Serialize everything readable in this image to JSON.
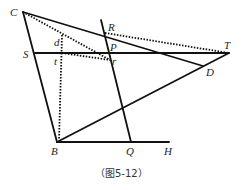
{
  "figure": {
    "caption": "（图5-12）",
    "points": {
      "C": {
        "label": "C",
        "x": 23,
        "y": 12
      },
      "R": {
        "label": "R",
        "x": 105,
        "y": 33
      },
      "P": {
        "label": "P",
        "x": 108,
        "y": 53
      },
      "T": {
        "label": "T",
        "x": 229,
        "y": 53
      },
      "S": {
        "label": "S",
        "x": 35,
        "y": 53
      },
      "d": {
        "label": "d",
        "x": 62,
        "y": 35
      },
      "t": {
        "label": "t",
        "x": 62,
        "y": 53
      },
      "r": {
        "label": "r",
        "x": 110,
        "y": 60
      },
      "D": {
        "label": "D",
        "x": 203,
        "y": 66
      },
      "B": {
        "label": "B",
        "x": 57,
        "y": 142
      },
      "Q": {
        "label": "Q",
        "x": 131,
        "y": 142
      },
      "H": {
        "label": "H",
        "x": 169,
        "y": 142
      }
    },
    "solid_segments": [
      "C-B",
      "C-D",
      "S-T",
      "B-T",
      "B-H",
      "line-through-R-P-Q"
    ],
    "dotted_segments": [
      "C-r",
      "d-B",
      "t-r",
      "R-T"
    ],
    "stroke_color": "#111111"
  }
}
